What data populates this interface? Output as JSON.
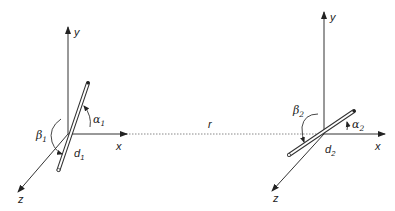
{
  "diagram": {
    "type": "two-dipole coordinate geometry",
    "separation_label": "r",
    "systems": [
      {
        "id": 1,
        "axes": {
          "x": "x",
          "y": "y",
          "z": "z"
        },
        "angle_alpha": {
          "symbol": "α",
          "sub": "1"
        },
        "angle_beta": {
          "symbol": "β",
          "sub": "1"
        },
        "dipole": {
          "symbol": "d",
          "sub": "1"
        }
      },
      {
        "id": 2,
        "axes": {
          "x": "x",
          "y": "y",
          "z": "z"
        },
        "angle_alpha": {
          "symbol": "α",
          "sub": "2"
        },
        "angle_beta": {
          "symbol": "β",
          "sub": "2"
        },
        "dipole": {
          "symbol": "d",
          "sub": "2"
        }
      }
    ],
    "colors": {
      "stroke": "#333333",
      "dotted": "#777777",
      "background": "#ffffff"
    }
  }
}
